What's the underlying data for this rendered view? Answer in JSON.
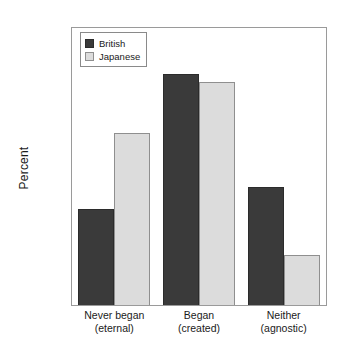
{
  "chart_data": {
    "type": "bar",
    "title": "",
    "subtitle": "",
    "xlabel": "",
    "ylabel": "Percent",
    "categories": [
      "Never began\n(eternal)",
      "Began\n(created)",
      "Neither\n(agnostic)"
    ],
    "category_lines": [
      [
        "Never began",
        "(eternal)"
      ],
      [
        "Began",
        "(created)"
      ],
      [
        "Neither",
        "(agnostic)"
      ]
    ],
    "series": [
      {
        "name": "British",
        "color": "#3a3a3a",
        "values": [
          21.6,
          51.7,
          26.4
        ]
      },
      {
        "name": "Japanese",
        "color": "#dcdcdc",
        "values": [
          38.5,
          50.0,
          11.3
        ]
      }
    ],
    "ylim": [
      0,
      62
    ],
    "yticks": [
      0,
      10,
      20,
      30,
      40,
      50,
      60
    ],
    "ytick_labels": [
      ".0%",
      "10.0%",
      "20.0%",
      "30.0%",
      "40.0%",
      "50.0%",
      "60.0%"
    ],
    "grid": false,
    "legend_position": "top-left",
    "bar_grouping": "grouped",
    "frame": true
  },
  "axis": {
    "y_title": "Percent"
  },
  "legend": {
    "entries": [
      {
        "label": "British"
      },
      {
        "label": "Japanese"
      }
    ]
  }
}
